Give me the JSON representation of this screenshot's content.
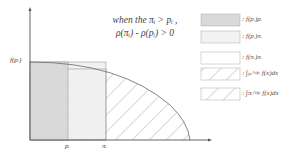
{
  "condition": {
    "line1": "when the πᵢ > pᵢ ,",
    "line2": "ρ(πᵢ) - ρ(pᵢ) > 0"
  },
  "axes": {
    "y_tick_label": "f(pᵢ)",
    "x_tick_labels": [
      "pᵢ",
      "πᵢ"
    ]
  },
  "legend": [
    {
      "label": ": f(pᵢ)pᵢ",
      "style": "dark-fill"
    },
    {
      "label": ": f(pᵢ)πᵢ",
      "style": "light-fill"
    },
    {
      "label": ": f(πᵢ)πᵢ",
      "style": "white"
    },
    {
      "label": ": ∫ₚᵢ^∞ f(x)dx",
      "style": "hatch"
    },
    {
      "label": ": ∫πᵢ^∞ f(x)dx",
      "style": "hatch"
    }
  ],
  "colors": {
    "dark_fill": "#d9d9d9",
    "light_fill": "#efefef",
    "line": "#777777",
    "hatch": "#999999"
  }
}
